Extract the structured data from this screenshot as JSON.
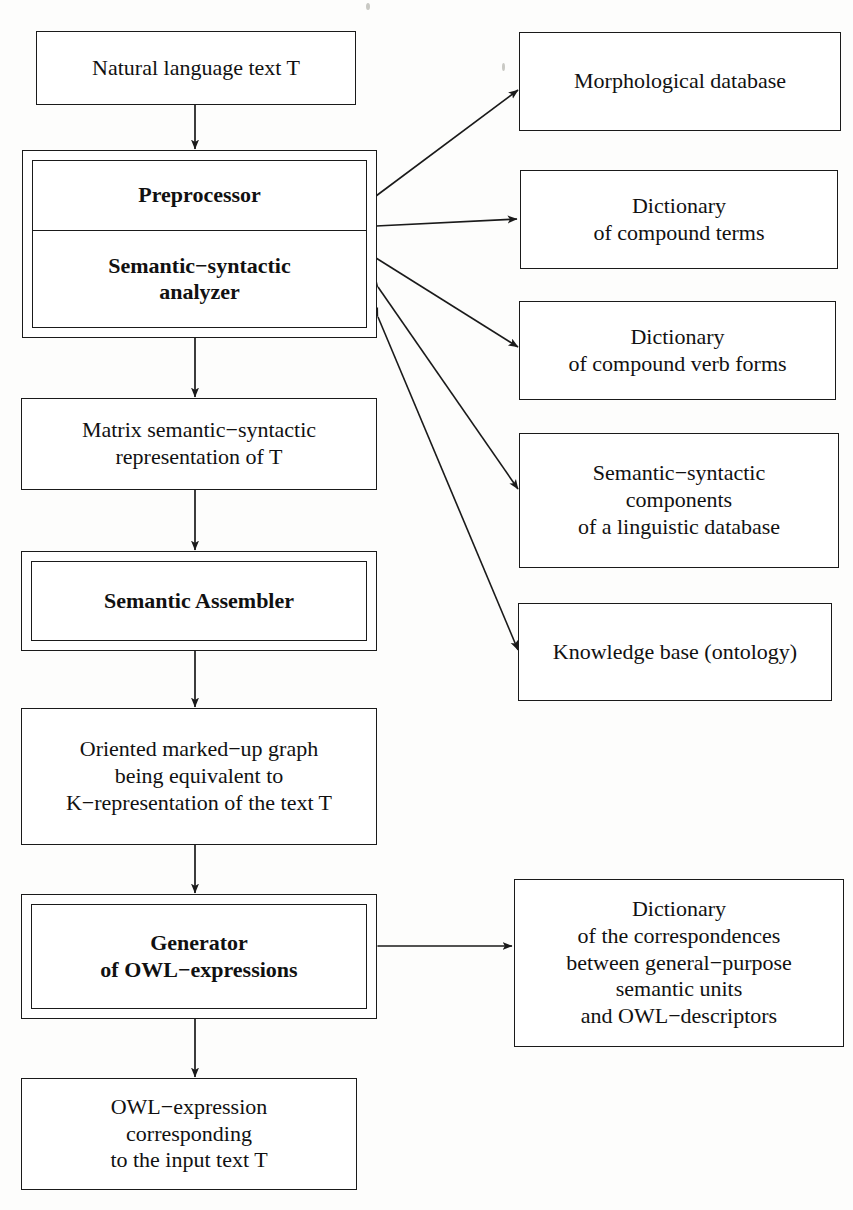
{
  "diagram": {
    "stroke_color": "#1a1a1a",
    "background_color": "#fdfdfc",
    "nodes": {
      "input_text": "Natural language text T",
      "preprocessor": "Preprocessor",
      "analyzer": "Semantic−syntactic\nanalyzer",
      "matrix_representation": "Matrix semantic−syntactic\nrepresentation of T",
      "semantic_assembler": "Semantic Assembler",
      "oriented_graph": "Oriented marked−up graph\nbeing equivalent to\nK−representation of the text T",
      "generator": "Generator\nof OWL−expressions",
      "owl_output": "OWL−expression\ncorresponding\nto the input text T",
      "morphological_database": "Morphological database",
      "dictionary_compound_terms": "Dictionary\nof compound terms",
      "dictionary_compound_verb_forms": "Dictionary\nof compound verb forms",
      "semantic_syntactic_components": "Semantic−syntactic\ncomponents\nof a linguistic database",
      "knowledge_base": "Knowledge base (ontology)",
      "dictionary_correspondences": "Dictionary\nof the correspondences\nbetween general−purpose\nsemantic units\nand OWL−descriptors"
    },
    "edges": [
      {
        "from": "input_text",
        "to": "preprocessor",
        "kind": "arrow-down"
      },
      {
        "from": "analyzer_module",
        "to": "matrix_representation",
        "kind": "arrow-down"
      },
      {
        "from": "matrix_representation",
        "to": "semantic_assembler",
        "kind": "arrow-down"
      },
      {
        "from": "semantic_assembler",
        "to": "oriented_graph",
        "kind": "arrow-down"
      },
      {
        "from": "oriented_graph",
        "to": "generator",
        "kind": "arrow-down"
      },
      {
        "from": "generator",
        "to": "owl_output",
        "kind": "arrow-down"
      },
      {
        "from": "analyzer_module",
        "to": "morphological_database",
        "kind": "bidirectional"
      },
      {
        "from": "analyzer_module",
        "to": "dictionary_compound_terms",
        "kind": "bidirectional"
      },
      {
        "from": "analyzer_module",
        "to": "dictionary_compound_verb_forms",
        "kind": "bidirectional"
      },
      {
        "from": "analyzer_module",
        "to": "semantic_syntactic_components",
        "kind": "bidirectional"
      },
      {
        "from": "analyzer_module",
        "to": "knowledge_base",
        "kind": "bidirectional"
      },
      {
        "from": "generator",
        "to": "dictionary_correspondences",
        "kind": "bidirectional"
      }
    ]
  }
}
